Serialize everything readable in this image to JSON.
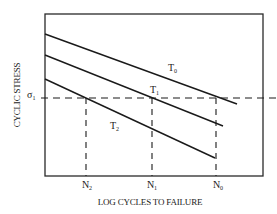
{
  "diagram": {
    "type": "S-N fatigue diagram (stress vs log cycles to failure at different temperatures)",
    "xlabel": "LOG CYCLES TO FAILURE",
    "ylabel": "CYCLIC STRESS",
    "stress_level": {
      "symbol": "σ",
      "subscript": "1"
    },
    "curves": [
      {
        "name": "T",
        "subscript": "0",
        "id": "T0"
      },
      {
        "name": "T",
        "subscript": "1",
        "id": "T1"
      },
      {
        "name": "T",
        "subscript": "2",
        "id": "T2"
      }
    ],
    "cycle_marks": [
      {
        "name": "N",
        "subscript": "2",
        "id": "N2"
      },
      {
        "name": "N",
        "subscript": "1",
        "id": "N1"
      },
      {
        "name": "N",
        "subscript": "0",
        "id": "N0"
      }
    ],
    "colors": {
      "line": "#1a1a1a",
      "background": "#ffffff"
    }
  }
}
